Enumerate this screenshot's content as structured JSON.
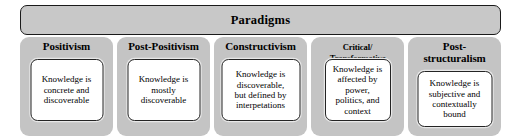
{
  "diagram": {
    "header": {
      "title": "Paradigms"
    },
    "columns": [
      {
        "id": "positivism",
        "title_lines": [
          "Positivism"
        ],
        "title_size": "normal",
        "description_lines": [
          "Knowledge is",
          "concrete and",
          "discoverable"
        ]
      },
      {
        "id": "post-positivism",
        "title_lines": [
          "Post-Positivism"
        ],
        "title_size": "normal",
        "description_lines": [
          "Knowledge is",
          "mostly",
          "discoverable"
        ]
      },
      {
        "id": "constructivism",
        "title_lines": [
          "Constructivism"
        ],
        "title_size": "normal",
        "description_lines": [
          "Knowledge is",
          "discoverable,",
          "but defined by",
          "interpetations"
        ]
      },
      {
        "id": "critical-transformative",
        "title_lines": [
          "Critical/",
          "Transformative"
        ],
        "title_size": "small",
        "description_lines": [
          "Knowledge is",
          "affected by",
          "power,",
          "politics, and",
          "context"
        ]
      },
      {
        "id": "post-structuralism",
        "title_lines": [
          "Post-",
          "structuralism"
        ],
        "title_size": "normal",
        "description_lines": [
          "Knowledge is",
          "subjective and",
          "contextually",
          "bound"
        ]
      }
    ],
    "colors": {
      "header_fill": "#c8c8c8",
      "column_fill": "#c4c4c4",
      "inner_fill": "#ffffff",
      "outline": "#1a1a1a",
      "background": "#ffffff"
    }
  }
}
